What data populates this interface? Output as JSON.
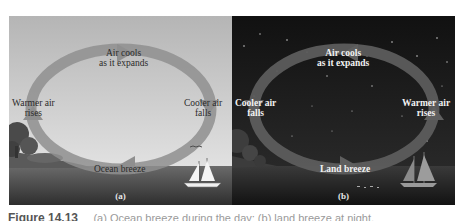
{
  "figure": {
    "panels": [
      {
        "id": "a",
        "sub_label": "(a)",
        "scene": "day",
        "labels": {
          "top": "Air cools\nas it expands",
          "left": "Warmer air\nrises",
          "right": "Cooler air\nfalls",
          "bottom": "Ocean breeze"
        },
        "colors": {
          "sky_top": "#b9b9b9",
          "sky_bottom": "#e3e3e3",
          "sea": "#3e3e3e",
          "arrow": "#8e8e8e"
        }
      },
      {
        "id": "b",
        "sub_label": "(b)",
        "scene": "night",
        "labels": {
          "top": "Air cools\nas it expands",
          "left": "Cooler air\nfalls",
          "right": "Warmer air\nrises",
          "bottom": "Land breeze"
        },
        "colors": {
          "sky_top": "#141414",
          "sky_bottom": "#2a2a2a",
          "sea": "#1a1a1a",
          "arrow": "#5a5a5a"
        }
      }
    ]
  },
  "caption": {
    "figure_number": "Figure 14.13",
    "text": "(a) Ocean breeze during the day; (b) land breeze at night."
  }
}
